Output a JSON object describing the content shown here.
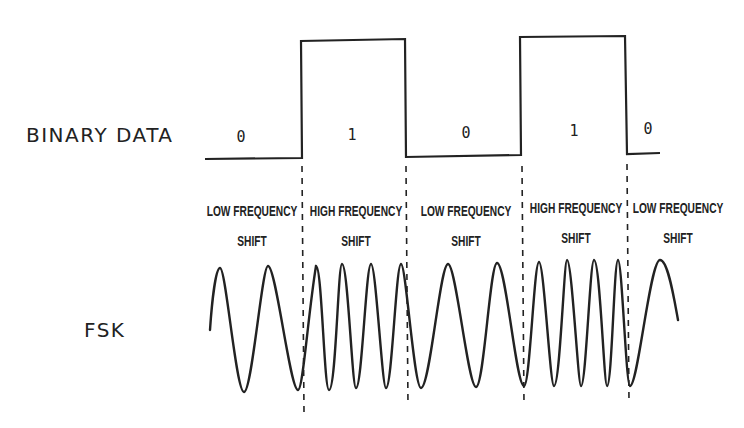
{
  "labels": {
    "binary_data": "BINARY DATA",
    "fsk": "FSK"
  },
  "bits": [
    {
      "value": "0",
      "x": 241,
      "y": 128
    },
    {
      "value": "1",
      "x": 352,
      "y": 126
    },
    {
      "value": "0",
      "x": 466,
      "y": 124
    },
    {
      "value": "1",
      "x": 574,
      "y": 122
    },
    {
      "value": "0",
      "x": 648,
      "y": 120
    }
  ],
  "segments": [
    {
      "line1": "LOW FREQUENCY",
      "line2": "SHIFT",
      "x": 252
    },
    {
      "line1": "HIGH FREQUENCY",
      "line2": "SHIFT",
      "x": 356
    },
    {
      "line1": "LOW FREQUENCY",
      "line2": "SHIFT",
      "x": 466
    },
    {
      "line1": "HIGH FREQUENCY",
      "line2": "SHIFT",
      "x": 576
    },
    {
      "line1": "LOW FREQUENCY",
      "line2": "SHIFT",
      "x": 678
    }
  ],
  "colors": {
    "line": "#222222",
    "background": "#ffffff"
  }
}
